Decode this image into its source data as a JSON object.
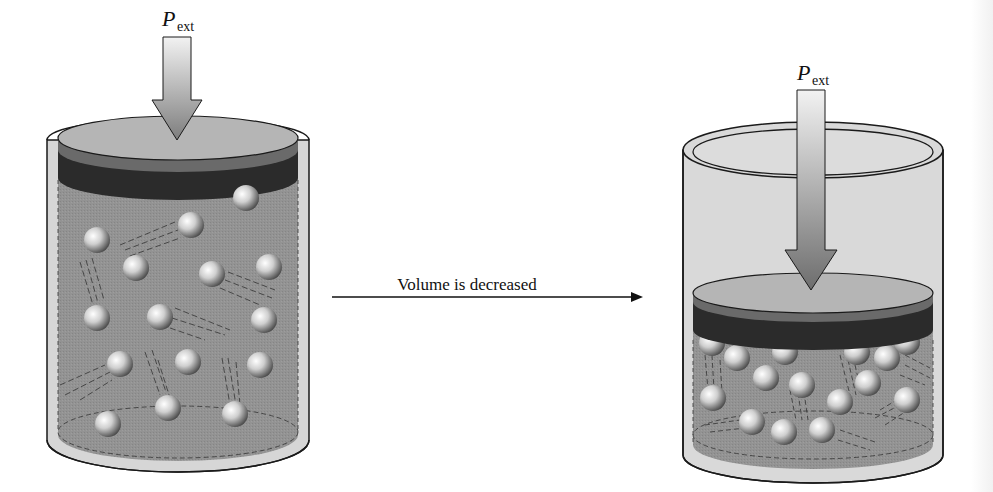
{
  "diagram": {
    "type": "gas-compression-illustration",
    "left_panel": {
      "label_main": "P",
      "label_sub": "ext",
      "state": "larger volume",
      "molecule_count": 17
    },
    "transition": {
      "label": "Volume is decreased",
      "arrow_direction": "right"
    },
    "right_panel": {
      "label_main": "P",
      "label_sub": "ext",
      "state": "smaller volume",
      "molecule_count": 19
    },
    "colors": {
      "cylinder_wall": "#d9d9d9",
      "cylinder_outline": "#1a1a1a",
      "gas_fill": "#8f8f8f",
      "piston_top": "#b3b3b3",
      "piston_band": "#2b2b2b",
      "arrow_light": "#eeeeee",
      "arrow_dark": "#7a7a7a",
      "molecule_highlight": "#ffffff",
      "molecule_shadow": "#555555"
    }
  }
}
